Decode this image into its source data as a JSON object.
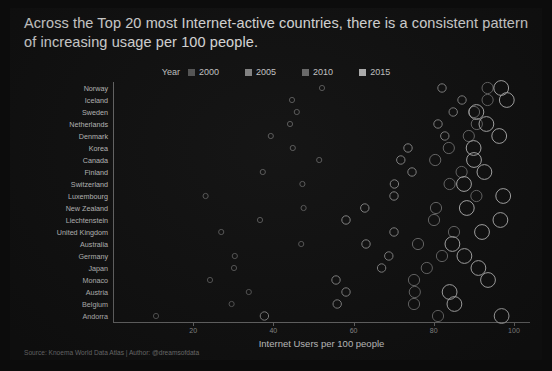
{
  "title": "Across the Top 20 most Internet-active countries, there is a consistent pattern of increasing usage per 100 people.",
  "legend": {
    "title": "Year",
    "entries": [
      {
        "label": "2000",
        "color": "#5b5b5b"
      },
      {
        "label": "2005",
        "color": "#8a8a8a"
      },
      {
        "label": "2010",
        "color": "#6f6f6f"
      },
      {
        "label": "2015",
        "color": "#b9b9b9"
      }
    ]
  },
  "source": "Source: Knoema World Data Atlas | Author: @dreamsofdata",
  "chart_data": {
    "type": "scatter",
    "title": "Across the Top 20 most Internet-active countries, there is a consistent pattern of increasing usage per 100 people.",
    "xlabel": "Internet Users per 100 people",
    "ylabel": "",
    "xlim": [
      0,
      104
    ],
    "xticks": [
      20,
      40,
      60,
      80,
      100
    ],
    "xticklabels": [
      "20",
      "40",
      "60",
      "80",
      "100"
    ],
    "grid": false,
    "legend_position": "top-center",
    "marker": "open-circle",
    "size_encodes": "year",
    "categories": [
      "Norway",
      "Iceland",
      "Sweden",
      "Netherlands",
      "Denmark",
      "Korea",
      "Canada",
      "Finland",
      "Switzerland",
      "Luxembourg",
      "New Zealand",
      "Liechtenstein",
      "United Kingdom",
      "Australia",
      "Germany",
      "Japan",
      "Monaco",
      "Austria",
      "Belgium",
      "Andorra"
    ],
    "series": [
      {
        "name": "2000",
        "color": "#5b5b5b",
        "radius": 2.6,
        "values": [
          52.0,
          44.5,
          45.7,
          44.0,
          39.2,
          44.7,
          51.3,
          37.2,
          47.1,
          22.9,
          47.4,
          36.5,
          26.8,
          46.8,
          30.2,
          30.0,
          24.0,
          33.7,
          29.4,
          10.5
        ]
      },
      {
        "name": "2005",
        "color": "#8a8a8a",
        "radius": 4.2,
        "values": [
          82.0,
          87.0,
          84.8,
          81.0,
          82.7,
          73.5,
          71.7,
          74.5,
          70.1,
          70.0,
          62.7,
          58.0,
          70.0,
          63.0,
          68.7,
          66.9,
          55.5,
          58.0,
          55.8,
          37.6
        ]
      },
      {
        "name": "2010",
        "color": "#6f6f6f",
        "radius": 5.6,
        "values": [
          93.4,
          93.4,
          90.0,
          90.7,
          88.7,
          83.7,
          80.3,
          86.9,
          83.9,
          90.6,
          80.5,
          80.0,
          85.0,
          76.0,
          82.0,
          78.2,
          75.0,
          75.2,
          75.0,
          81.0
        ]
      },
      {
        "name": "2015",
        "color": "#b9b9b9",
        "radius": 7.4,
        "values": [
          96.8,
          98.2,
          90.6,
          93.1,
          96.3,
          89.9,
          90.0,
          92.6,
          87.5,
          97.3,
          88.2,
          96.6,
          92.0,
          84.6,
          87.6,
          91.1,
          93.5,
          83.9,
          85.1,
          96.9
        ]
      }
    ]
  }
}
